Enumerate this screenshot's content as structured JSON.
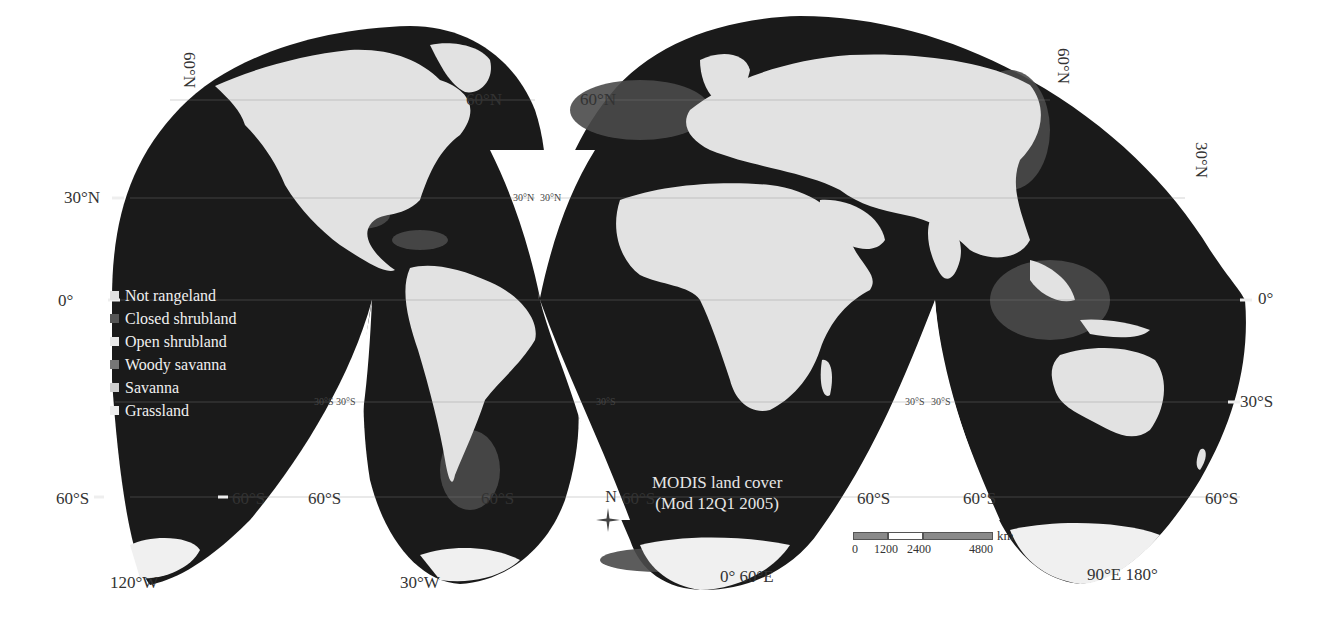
{
  "map": {
    "projection": "interrupted-goode-homolosine",
    "caption_line1": "MODIS land cover",
    "caption_line2": "(Mod 12Q1 2005)",
    "colors": {
      "ocean": "#1a1a1a",
      "shelf": "#555555",
      "land_light": "#e4e4e4",
      "ice": "#f2f2f2",
      "background": "#ffffff"
    }
  },
  "legend": {
    "items": [
      {
        "label": "Not rangeland",
        "color": "#e0e0e0"
      },
      {
        "label": "Closed shrubland",
        "color": "#555555"
      },
      {
        "label": "Open shrubland",
        "color": "#e6e6e6"
      },
      {
        "label": "Woody savanna",
        "color": "#777777"
      },
      {
        "label": "Savanna",
        "color": "#cfcfcf"
      },
      {
        "label": "Grassland",
        "color": "#ececec"
      }
    ]
  },
  "graticule_labels": {
    "lat_60N_left_vertical": "60°N",
    "lat_60N_na_right": "60°N",
    "lat_60N_eurasia_left": "60°N",
    "lat_60N_right_vertical": "60°N",
    "lat_30N_left": "30°N",
    "lat_30N_gap_a": "30°N",
    "lat_30N_gap_b": "30°N",
    "lat_30N_right_vertical": "30°N",
    "lat_0_left": "0°",
    "lat_0_right": "0°",
    "lat_30S_gap1_a": "30°S",
    "lat_30S_gap1_b": "30°S",
    "lat_30S_gap2": "30°S",
    "lat_30S_gap3_a": "30°S",
    "lat_30S_gap3_b": "30°S",
    "lat_30S_right": "30°S",
    "lat_60S_l1_left": "60°S",
    "lat_60S_l1_right": "60°S",
    "lat_60S_l2_left": "60°S",
    "lat_60S_l2_right": "60°S",
    "lat_60S_l3_left": "60°S",
    "lat_60S_l3_right": "60°S",
    "lat_60S_l4_left": "60°S",
    "lat_60S_l4_right": "60°S",
    "lon_120W": "120°W",
    "lon_30W": "30°W",
    "lon_0_60E": "0° 60°E",
    "lon_90E_180": "90°E 180°"
  },
  "scale_bar": {
    "unit": "km",
    "ticks": [
      "0",
      "1200",
      "2400",
      "4800"
    ]
  },
  "north_arrow": {
    "label": "N"
  }
}
